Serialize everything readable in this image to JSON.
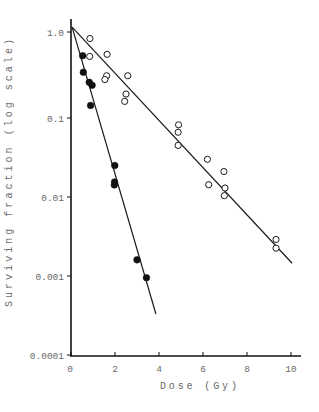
{
  "chart_data": {
    "type": "scatter",
    "title": "",
    "xlabel": "Dose (Gy)",
    "ylabel": "Surviving fraction (log scale)",
    "xlim": [
      0,
      10.4
    ],
    "ylim": [
      0.0001,
      1.3
    ],
    "yscale": "log",
    "grid": false,
    "legend": null,
    "xticks": [
      "0",
      "2",
      "4",
      "6",
      "8",
      "10"
    ],
    "yticks": [
      "0.0001",
      "0.001",
      "0.01",
      "0.1",
      "1.0"
    ],
    "series": [
      {
        "name": "open circles",
        "marker": "open-circle",
        "points": [
          [
            0.86,
            0.84
          ],
          [
            0.85,
            0.52
          ],
          [
            1.64,
            0.55
          ],
          [
            1.62,
            0.31
          ],
          [
            1.54,
            0.28
          ],
          [
            2.58,
            0.31
          ],
          [
            2.5,
            0.19
          ],
          [
            2.44,
            0.156
          ],
          [
            4.89,
            0.082
          ],
          [
            4.87,
            0.066
          ],
          [
            4.87,
            0.045
          ],
          [
            6.2,
            0.03
          ],
          [
            6.95,
            0.021
          ],
          [
            6.26,
            0.0143
          ],
          [
            7.0,
            0.013
          ],
          [
            6.97,
            0.0104
          ],
          [
            9.32,
            0.0029
          ],
          [
            9.32,
            0.00225
          ]
        ],
        "fit_line": [
          [
            0.05,
            1.14
          ],
          [
            10.05,
            0.00145
          ]
        ]
      },
      {
        "name": "filled circles",
        "marker": "filled-circle",
        "points": [
          [
            0.53,
            0.53
          ],
          [
            0.56,
            0.34
          ],
          [
            0.83,
            0.26
          ],
          [
            0.96,
            0.24
          ],
          [
            0.89,
            0.14
          ],
          [
            1.99,
            0.025
          ],
          [
            1.98,
            0.0155
          ],
          [
            1.97,
            0.0142
          ],
          [
            3.0,
            0.0016
          ],
          [
            3.43,
            0.00095
          ]
        ],
        "fit_line": [
          [
            0.05,
            1.14
          ],
          [
            3.86,
            0.00033
          ]
        ]
      }
    ]
  }
}
